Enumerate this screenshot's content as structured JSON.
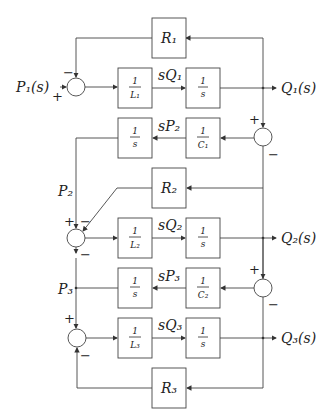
{
  "diagram": {
    "signals": {
      "input": "P₁(s)",
      "out1": "Q₁(s)",
      "out2": "Q₂(s)",
      "out3": "Q₃(s)",
      "sQ1": "sQ₁",
      "sQ2": "sQ₂",
      "sQ3": "sQ₃",
      "sP2": "sP₂",
      "sP3": "sP₃",
      "P2": "P₂",
      "P3": "P₃"
    },
    "blocks": {
      "R1": "R₁",
      "R2": "R₂",
      "R3": "R₃",
      "L1_num": "1",
      "L1_den": "L₁",
      "L2_num": "1",
      "L2_den": "L₂",
      "L3_num": "1",
      "L3_den": "L₃",
      "C1_num": "1",
      "C1_den": "C₁",
      "C2_num": "1",
      "C2_den": "C₂",
      "int_num": "1",
      "int_den": "s"
    },
    "signs": {
      "plus": "+",
      "minus": "−"
    }
  }
}
